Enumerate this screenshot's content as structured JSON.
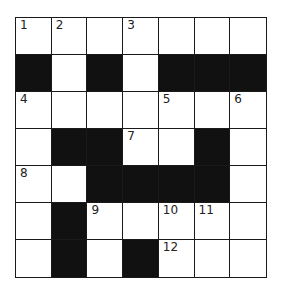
{
  "crossword": {
    "rows": 7,
    "cols": 7,
    "colors": {
      "black": "#111111",
      "white": "#ffffff",
      "line": "#1a1a1a"
    },
    "grid": [
      [
        "1",
        "2",
        "",
        "3",
        "",
        "",
        ""
      ],
      [
        "#",
        "",
        "#",
        "",
        "#",
        "#",
        "#"
      ],
      [
        "4",
        "",
        "",
        "",
        "5",
        "",
        "6"
      ],
      [
        "",
        "#",
        "#",
        "7",
        "",
        "#",
        ""
      ],
      [
        "8",
        "",
        "#",
        "#",
        "#",
        "#",
        ""
      ],
      [
        "",
        "#",
        "9",
        "",
        "10",
        "11",
        ""
      ],
      [
        "",
        "#",
        "",
        "#",
        "12",
        "",
        ""
      ]
    ]
  }
}
